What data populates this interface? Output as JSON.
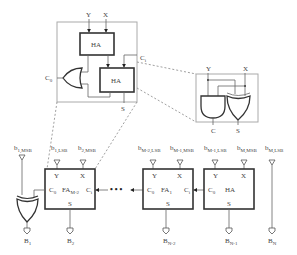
{
  "figure": {
    "title": "",
    "zoom_fa": {
      "ha_top_label": "HA",
      "ha_bottom_label": "HA",
      "input_y": "Y",
      "input_x": "X",
      "carry_out": "C",
      "carry_out_sub": "0",
      "carry_in": "C",
      "carry_in_sub": "i",
      "sum": "S"
    },
    "zoom_ha": {
      "input_y": "Y",
      "input_x": "X",
      "carry": "C",
      "sum": "S",
      "gates": [
        "AND",
        "XOR"
      ]
    },
    "chain": {
      "blocks": [
        {
          "name": "FA",
          "sub": "M-2",
          "y": "Y",
          "x": "X",
          "c0": "C",
          "c0_sub": "0",
          "ci": "C",
          "ci_sub": "i",
          "s": "S"
        },
        {
          "name": "FA",
          "sub": "1",
          "y": "Y",
          "x": "X",
          "c0": "C",
          "c0_sub": "0",
          "ci": "C",
          "ci_sub": "i",
          "s": "S"
        },
        {
          "name": "HA",
          "sub": "",
          "y": "Y",
          "x": "X",
          "c0": "C",
          "c0_sub": "0",
          "s": "S"
        }
      ],
      "ellipsis": "• • •",
      "inputs": [
        {
          "main": "b",
          "sub": "1,MSB"
        },
        {
          "main": "b",
          "sub": "1,LSB"
        },
        {
          "main": "b",
          "sub": "2,MSB"
        },
        {
          "main": "b",
          "sub": "M-2,LSB"
        },
        {
          "main": "b",
          "sub": "M-1,MSB"
        },
        {
          "main": "b",
          "sub": "M-1,LSB"
        },
        {
          "main": "b",
          "sub": "M,MSB"
        },
        {
          "main": "b",
          "sub": "M,LSB"
        }
      ],
      "outputs": [
        {
          "main": "B",
          "sub": "1"
        },
        {
          "main": "B",
          "sub": "2"
        },
        {
          "main": "B",
          "sub": "N-2"
        },
        {
          "main": "B",
          "sub": "N-1"
        },
        {
          "main": "B",
          "sub": "N"
        }
      ]
    }
  }
}
